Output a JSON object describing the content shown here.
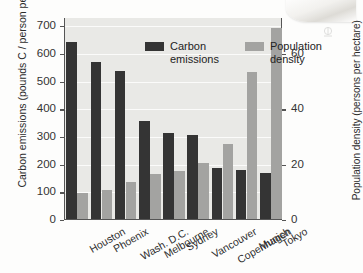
{
  "chart_data": {
    "type": "bar",
    "title": "",
    "xlabel": "",
    "ylabel": "Carbon emissions (pounds C / person per year)",
    "y2label": "Population density (persons per hectare)",
    "categories": [
      "Houston",
      "Phoenix",
      "Wash. D.C.",
      "Melbourne",
      "Sydney",
      "Vancouver",
      "Copenhagen",
      "Munich",
      "Tokyo"
    ],
    "series": [
      {
        "name": "Carbon emissions",
        "axis": "left",
        "color": "#343434",
        "values": [
          645,
          570,
          540,
          357,
          315,
          307,
          189,
          180,
          170
        ]
      },
      {
        "name": "Population density",
        "axis": "right",
        "color": "#a3a3a1",
        "values": [
          9.6,
          11.0,
          13.6,
          16.5,
          17.7,
          20.7,
          27.5,
          53.5,
          69.5
        ]
      }
    ],
    "ylim": [
      0,
      730
    ],
    "y2lim": [
      0,
      73
    ],
    "yticks": [
      0,
      100,
      200,
      300,
      400,
      500,
      600,
      700
    ],
    "y2ticks": [
      0,
      20,
      40,
      60
    ],
    "grid": true,
    "legend_position": "top-left",
    "plot_background": "#e9e9e6"
  },
  "legend": {
    "items": [
      {
        "label": "Carbon emissions",
        "color": "#343434"
      },
      {
        "label": "Population density",
        "color": "#a3a3a1"
      }
    ]
  }
}
